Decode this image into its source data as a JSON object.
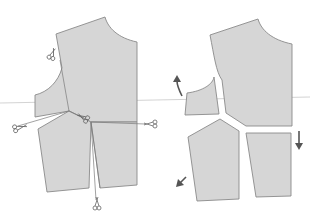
{
  "diagram": {
    "left_figure": {
      "label": "uncut bodice with cutting lines",
      "scissors_count": 5
    },
    "right_figure": {
      "label": "bodice separated into pieces",
      "pieces_count": 4,
      "arrows": [
        "up-curved",
        "down",
        "down-left"
      ]
    },
    "colors": {
      "piece_fill": "#d6d6d6",
      "outline": "#8a8a8a",
      "arrow": "#555555"
    }
  }
}
